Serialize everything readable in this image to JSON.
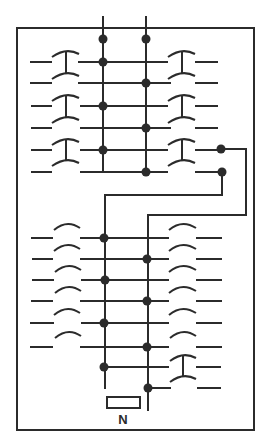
{
  "diagram": {
    "type": "switch-panel schematic",
    "label": "N",
    "colors": {
      "ink": "#2b2b2b",
      "background": "#ffffff"
    },
    "frame": {
      "x": 17,
      "y": 28,
      "w": 237,
      "h": 402
    },
    "buses": {
      "left_x": 103,
      "right_x": 146,
      "top_y": 17
    },
    "top_section": {
      "rows_y": [
        62,
        83,
        106,
        128,
        150,
        172
      ],
      "left_dots": [
        62,
        106,
        150
      ],
      "right_dots": [
        83,
        128,
        172
      ],
      "top_dots_y": 39,
      "contacts": "three switch pairs (T-shaped closed contacts) on each side"
    },
    "bottom_section": {
      "rows_y": [
        238,
        259,
        280,
        301,
        323,
        347,
        367,
        388
      ],
      "left_dots": [
        238,
        280,
        323,
        367
      ],
      "right_dots": [
        259,
        301,
        347,
        388
      ],
      "contacts": "open arc contacts; one closed T-contact at lower right"
    },
    "cross_links": [
      {
        "from": "right dot at row 172",
        "to": "left bus via y=195"
      },
      {
        "from": "right dot at row 150",
        "to": "right bus via x=246, y=215"
      }
    ]
  }
}
